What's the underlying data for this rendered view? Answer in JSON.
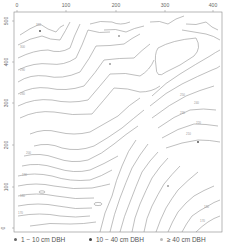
{
  "map": {
    "type": "contour",
    "x_ticks": [
      {
        "label": "0",
        "px": 17
      },
      {
        "label": "100",
        "px": 66
      },
      {
        "label": "200",
        "px": 116
      },
      {
        "label": "300",
        "px": 165
      },
      {
        "label": "400",
        "px": 213
      }
    ],
    "y_ticks": [
      {
        "label": "500",
        "py": 21
      },
      {
        "label": "400",
        "py": 62
      },
      {
        "label": "300",
        "py": 103
      },
      {
        "label": "200",
        "py": 145
      },
      {
        "label": "100",
        "py": 187
      },
      {
        "label": "0",
        "py": 228
      }
    ],
    "xlim": [
      0,
      420
    ],
    "ylim": [
      0,
      510
    ],
    "frame_color": "#888888",
    "contour_color": "#8a8a8a"
  },
  "legend": {
    "items": [
      {
        "label": "1 − 10 cm DBH",
        "color": "#666666"
      },
      {
        "label": "10 − 40 cm DBH",
        "color": "#444444"
      },
      {
        "label": "≥ 40 cm DBH",
        "color": "#bbbbbb"
      }
    ]
  }
}
